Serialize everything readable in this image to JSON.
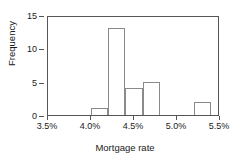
{
  "chart_data": {
    "type": "bar",
    "title": "",
    "xlabel": "Mortgage rate",
    "ylabel": "Frequency",
    "categories": [
      "4.0%-4.2%",
      "4.2%-4.4%",
      "4.4%-4.6%",
      "4.6%-4.8%",
      "5.2%-5.4%"
    ],
    "values": [
      1,
      13,
      4,
      5,
      2
    ],
    "bins": [
      {
        "left": 4.0,
        "right": 4.2,
        "count": 1
      },
      {
        "left": 4.2,
        "right": 4.4,
        "count": 13
      },
      {
        "left": 4.4,
        "right": 4.6,
        "count": 4
      },
      {
        "left": 4.6,
        "right": 4.8,
        "count": 5
      },
      {
        "left": 5.2,
        "right": 5.4,
        "count": 2
      }
    ],
    "xlim": [
      3.5,
      5.5
    ],
    "ylim": [
      0,
      15
    ],
    "xticks": [
      "3.5%",
      "4.0%",
      "4.5%",
      "5.0%",
      "5.5%"
    ],
    "xtick_values": [
      3.5,
      4.0,
      4.5,
      5.0,
      5.5
    ],
    "yticks": [
      "0",
      "5",
      "10",
      "15"
    ],
    "ytick_values": [
      0,
      5,
      10,
      15
    ],
    "grid": false,
    "legend": false,
    "bar_fill": "#ffffff",
    "bar_edge": "#8a8a8a",
    "axis_color": "#555555",
    "text_color": "#1a1a1a"
  }
}
